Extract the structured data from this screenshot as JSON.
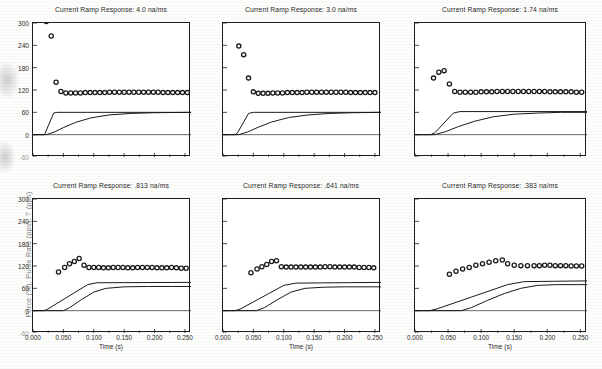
{
  "figure": {
    "ylabel": "Force (%), Pulse Rate (pps), T (pps)",
    "xlabel": "Time (s)",
    "yticks": [
      "300",
      "240",
      "180",
      "120",
      "60",
      "0",
      "-60"
    ],
    "ytick_values": [
      300,
      240,
      180,
      120,
      60,
      0,
      -60
    ],
    "xticks": [
      "0.000",
      "0.050",
      "0.100",
      "0.150",
      "0.200",
      "0.250"
    ],
    "xtick_values": [
      0.0,
      0.05,
      0.1,
      0.15,
      0.2,
      0.25
    ],
    "ylim": [
      -60,
      300
    ],
    "xlim": [
      0.0,
      0.26
    ],
    "marker_color": "#1a1a1a",
    "line_color": "#1a1a1a",
    "axis_color": "#1d1d1d"
  },
  "chart_data": [
    {
      "type": "scatter",
      "panel": "top-left",
      "title": "Current Ramp Response: 4.0 na/ms",
      "ramp_rate": "4.0 na/ms",
      "xlabel": "",
      "ylabel": "",
      "xlim": [
        0.0,
        0.26
      ],
      "ylim": [
        -60,
        300
      ],
      "grid": false,
      "legend": "none",
      "series": [
        {
          "name": "Pulse Rate (pps)",
          "kind": "scatter",
          "x": [
            0.022,
            0.03,
            0.038,
            0.046,
            0.054,
            0.062,
            0.07,
            0.078,
            0.086,
            0.094,
            0.102,
            0.11,
            0.118,
            0.126,
            0.134,
            0.142,
            0.15,
            0.158,
            0.166,
            0.174,
            0.182,
            0.19,
            0.198,
            0.206,
            0.214,
            0.222,
            0.23,
            0.238,
            0.246,
            0.254
          ],
          "y": [
            304,
            265,
            141,
            116,
            112,
            112,
            112,
            112,
            113,
            113,
            113,
            113,
            113,
            114,
            114,
            114,
            114,
            114,
            114,
            114,
            114,
            114,
            114,
            114,
            113,
            113,
            113,
            113,
            113,
            113
          ]
        },
        {
          "name": "Stimulus ramp (T)",
          "kind": "line",
          "x": [
            0.0,
            0.018,
            0.02,
            0.034,
            0.04,
            0.26
          ],
          "y": [
            0,
            0,
            4,
            58,
            60,
            60
          ]
        },
        {
          "name": "Force (%)",
          "kind": "line",
          "x": [
            0.0,
            0.022,
            0.035,
            0.05,
            0.07,
            0.095,
            0.125,
            0.16,
            0.2,
            0.26
          ],
          "y": [
            0,
            0,
            7,
            19,
            33,
            45,
            53,
            57,
            59,
            60
          ]
        }
      ]
    },
    {
      "type": "scatter",
      "panel": "top-middle",
      "title": "Current Ramp Response: 3.0 na/ms",
      "ramp_rate": "3.0 na/ms",
      "xlabel": "",
      "ylabel": "",
      "xlim": [
        0.0,
        0.26
      ],
      "ylim": [
        -60,
        300
      ],
      "grid": false,
      "legend": "none",
      "series": [
        {
          "name": "Pulse Rate (pps)",
          "kind": "scatter",
          "x": [
            0.026,
            0.034,
            0.042,
            0.05,
            0.058,
            0.066,
            0.074,
            0.082,
            0.09,
            0.098,
            0.106,
            0.114,
            0.122,
            0.13,
            0.138,
            0.146,
            0.154,
            0.162,
            0.17,
            0.178,
            0.186,
            0.194,
            0.202,
            0.21,
            0.218,
            0.226,
            0.234,
            0.242,
            0.25
          ],
          "y": [
            238,
            215,
            152,
            115,
            111,
            111,
            111,
            112,
            112,
            112,
            113,
            113,
            113,
            113,
            114,
            114,
            114,
            114,
            114,
            114,
            114,
            114,
            114,
            113,
            113,
            113,
            113,
            113,
            113
          ]
        },
        {
          "name": "Stimulus ramp (T)",
          "kind": "line",
          "x": [
            0.0,
            0.02,
            0.024,
            0.042,
            0.05,
            0.26
          ],
          "y": [
            0,
            0,
            5,
            57,
            60,
            60
          ]
        },
        {
          "name": "Force (%)",
          "kind": "line",
          "x": [
            0.0,
            0.026,
            0.04,
            0.058,
            0.08,
            0.108,
            0.14,
            0.175,
            0.215,
            0.26
          ],
          "y": [
            0,
            0,
            7,
            20,
            34,
            46,
            53,
            57,
            59,
            60
          ]
        }
      ]
    },
    {
      "type": "scatter",
      "panel": "top-right",
      "title": "Current Ramp Response: 1.74 na/ms",
      "ramp_rate": "1.74 na/ms",
      "xlabel": "",
      "ylabel": "",
      "xlim": [
        0.0,
        0.26
      ],
      "ylim": [
        -60,
        300
      ],
      "grid": false,
      "legend": "none",
      "series": [
        {
          "name": "Pulse Rate (pps)",
          "kind": "scatter",
          "x": [
            0.028,
            0.036,
            0.044,
            0.052,
            0.06,
            0.068,
            0.076,
            0.084,
            0.092,
            0.1,
            0.108,
            0.116,
            0.124,
            0.132,
            0.14,
            0.148,
            0.156,
            0.164,
            0.172,
            0.18,
            0.188,
            0.196,
            0.204,
            0.212,
            0.22,
            0.228,
            0.236,
            0.244,
            0.252
          ],
          "y": [
            152,
            168,
            172,
            136,
            116,
            114,
            114,
            114,
            114,
            115,
            115,
            115,
            116,
            116,
            116,
            116,
            116,
            116,
            116,
            116,
            116,
            116,
            115,
            115,
            115,
            115,
            115,
            114,
            114
          ]
        },
        {
          "name": "Stimulus ramp (T)",
          "kind": "line",
          "x": [
            0.0,
            0.024,
            0.03,
            0.058,
            0.068,
            0.26
          ],
          "y": [
            0,
            0,
            5,
            58,
            62,
            62
          ]
        },
        {
          "name": "Force (%)",
          "kind": "line",
          "x": [
            0.0,
            0.03,
            0.046,
            0.066,
            0.09,
            0.118,
            0.15,
            0.185,
            0.22,
            0.26
          ],
          "y": [
            0,
            0,
            8,
            22,
            36,
            48,
            55,
            58,
            60,
            60
          ]
        }
      ]
    },
    {
      "type": "scatter",
      "panel": "bottom-left",
      "title": "Current Ramp Response: .813 na/ms",
      "ramp_rate": ".813 na/ms",
      "xlabel": "Time (s)",
      "ylabel": "",
      "xlim": [
        0.0,
        0.26
      ],
      "ylim": [
        -60,
        300
      ],
      "grid": false,
      "legend": "none",
      "series": [
        {
          "name": "Pulse Rate (pps)",
          "kind": "scatter",
          "x": [
            0.042,
            0.052,
            0.06,
            0.068,
            0.076,
            0.084,
            0.092,
            0.1,
            0.108,
            0.116,
            0.124,
            0.132,
            0.14,
            0.148,
            0.156,
            0.164,
            0.172,
            0.18,
            0.188,
            0.196,
            0.204,
            0.212,
            0.22,
            0.228,
            0.236,
            0.244,
            0.252
          ],
          "y": [
            104,
            116,
            126,
            132,
            140,
            122,
            116,
            116,
            116,
            115,
            115,
            116,
            116,
            116,
            115,
            115,
            116,
            116,
            116,
            116,
            115,
            115,
            115,
            116,
            115,
            114,
            114
          ]
        },
        {
          "name": "Stimulus ramp (T)",
          "kind": "line",
          "x": [
            0.0,
            0.018,
            0.024,
            0.09,
            0.105,
            0.26
          ],
          "y": [
            0,
            0,
            4,
            70,
            75,
            76
          ]
        },
        {
          "name": "Force (%)",
          "kind": "line",
          "x": [
            0.0,
            0.05,
            0.06,
            0.08,
            0.1,
            0.12,
            0.15,
            0.19,
            0.23,
            0.26
          ],
          "y": [
            0,
            0,
            8,
            30,
            50,
            60,
            64,
            65,
            65,
            65
          ]
        }
      ]
    },
    {
      "type": "scatter",
      "panel": "bottom-middle",
      "title": "Current Ramp Response: .641 na/ms",
      "ramp_rate": ".641 na/ms",
      "xlabel": "Time (s)",
      "ylabel": "",
      "xlim": [
        0.0,
        0.26
      ],
      "ylim": [
        -60,
        300
      ],
      "grid": false,
      "legend": "none",
      "series": [
        {
          "name": "Pulse Rate (pps)",
          "kind": "scatter",
          "x": [
            0.046,
            0.056,
            0.064,
            0.072,
            0.08,
            0.088,
            0.096,
            0.104,
            0.112,
            0.12,
            0.128,
            0.136,
            0.144,
            0.152,
            0.16,
            0.168,
            0.176,
            0.184,
            0.192,
            0.2,
            0.208,
            0.216,
            0.224,
            0.232,
            0.24,
            0.248
          ],
          "y": [
            102,
            112,
            118,
            124,
            132,
            134,
            118,
            117,
            117,
            117,
            117,
            117,
            117,
            117,
            117,
            118,
            118,
            117,
            117,
            117,
            117,
            117,
            116,
            116,
            116,
            115
          ]
        },
        {
          "name": "Stimulus ramp (T)",
          "kind": "line",
          "x": [
            0.0,
            0.02,
            0.028,
            0.1,
            0.12,
            0.26
          ],
          "y": [
            0,
            0,
            4,
            68,
            74,
            76
          ]
        },
        {
          "name": "Force (%)",
          "kind": "line",
          "x": [
            0.0,
            0.055,
            0.068,
            0.09,
            0.112,
            0.135,
            0.165,
            0.2,
            0.235,
            0.26
          ],
          "y": [
            0,
            0,
            8,
            30,
            50,
            60,
            63,
            64,
            64,
            64
          ]
        }
      ]
    },
    {
      "type": "scatter",
      "panel": "bottom-right",
      "title": "Current Ramp Response: .383 na/ms",
      "ramp_rate": ".383 na/ms",
      "xlabel": "Time (s)",
      "ylabel": "",
      "xlim": [
        0.0,
        0.26
      ],
      "ylim": [
        -60,
        300
      ],
      "grid": false,
      "legend": "none",
      "series": [
        {
          "name": "Pulse Rate (pps)",
          "kind": "scatter",
          "x": [
            0.052,
            0.062,
            0.072,
            0.082,
            0.092,
            0.102,
            0.112,
            0.122,
            0.132,
            0.14,
            0.15,
            0.16,
            0.17,
            0.18,
            0.188,
            0.196,
            0.204,
            0.212,
            0.22,
            0.228,
            0.236,
            0.244,
            0.252
          ],
          "y": [
            98,
            106,
            112,
            116,
            122,
            126,
            130,
            134,
            136,
            126,
            122,
            121,
            121,
            121,
            121,
            122,
            122,
            121,
            121,
            121,
            120,
            120,
            120
          ]
        },
        {
          "name": "Stimulus ramp (T)",
          "kind": "line",
          "x": [
            0.0,
            0.022,
            0.032,
            0.14,
            0.165,
            0.26
          ],
          "y": [
            0,
            0,
            4,
            70,
            78,
            80
          ]
        },
        {
          "name": "Force (%)",
          "kind": "line",
          "x": [
            0.0,
            0.07,
            0.085,
            0.11,
            0.135,
            0.16,
            0.185,
            0.215,
            0.245,
            0.26
          ],
          "y": [
            0,
            0,
            8,
            28,
            46,
            60,
            68,
            70,
            70,
            70
          ]
        }
      ]
    }
  ]
}
